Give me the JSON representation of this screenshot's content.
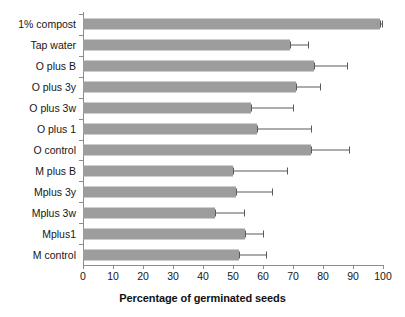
{
  "chart_data": {
    "type": "bar",
    "orientation": "horizontal",
    "title": "",
    "xlabel": "Percentage of germinated seeds",
    "ylabel": "",
    "xlim": [
      0,
      100
    ],
    "xticks": [
      0,
      10,
      20,
      30,
      40,
      50,
      60,
      70,
      80,
      90,
      100
    ],
    "grid": false,
    "legend": false,
    "bar_color": "#9d9d9d",
    "error_bar_color": "#5a5a5a",
    "axis_color": "#8c8c8c",
    "categories": [
      "1% compost",
      "Tap water",
      "O plus B",
      "O plus 3y",
      "O plus 3w",
      "O plus 1",
      "O control",
      "M plus B",
      "Mplus 3y",
      "Mplus 3w",
      "Mplus1",
      "M control"
    ],
    "values": [
      99,
      69,
      77,
      71,
      56,
      58,
      76,
      50,
      51,
      44,
      54,
      52
    ],
    "error_upper": [
      99.5,
      75,
      88,
      79,
      70,
      76,
      88.5,
      68,
      63,
      53.5,
      60,
      61
    ],
    "series": [
      {
        "name": "Percentage of germinated seeds",
        "values": [
          99,
          69,
          77,
          71,
          56,
          58,
          76,
          50,
          51,
          44,
          54,
          52
        ]
      }
    ]
  }
}
